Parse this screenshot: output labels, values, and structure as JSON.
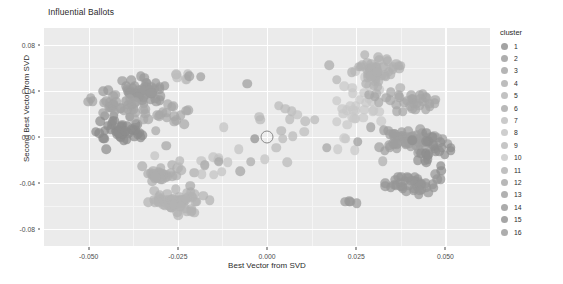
{
  "chart_data": {
    "type": "scatter",
    "title": "Influential Ballots",
    "xlabel": "Best Vector from SVD",
    "ylabel": "Second Best Vector from SVD",
    "xlim": [
      -0.0625,
      0.0625
    ],
    "ylim": [
      -0.095,
      0.095
    ],
    "xticks": [
      "-0.050",
      "-0.025",
      "0.000",
      "0.025",
      "0.050"
    ],
    "xtick_values": [
      -0.05,
      -0.025,
      0.0,
      0.025,
      0.05
    ],
    "yticks": [
      "0.08",
      "0.04",
      "0.00",
      "-0.04",
      "-0.08"
    ],
    "ytick_values": [
      0.08,
      0.04,
      0.0,
      -0.04,
      -0.08
    ],
    "grid": true,
    "panel_background": "#ebebeb",
    "gridline_color": "#ffffff",
    "legend": {
      "title": "cluster",
      "position": "right",
      "entries": [
        {
          "label": "1",
          "color": "#8c8c8c"
        },
        {
          "label": "2",
          "color": "#9a9a9a"
        },
        {
          "label": "3",
          "color": "#a3a3a3"
        },
        {
          "label": "4",
          "color": "#adadad"
        },
        {
          "label": "5",
          "color": "#b3b3b3"
        },
        {
          "label": "6",
          "color": "#a8a8a8"
        },
        {
          "label": "7",
          "color": "#bdbdbd"
        },
        {
          "label": "8",
          "color": "#c2c2c2"
        },
        {
          "label": "9",
          "color": "#b8b8b8"
        },
        {
          "label": "10",
          "color": "#c7c7c7"
        },
        {
          "label": "11",
          "color": "#b0b0b0"
        },
        {
          "label": "12",
          "color": "#a6a6a6"
        },
        {
          "label": "13",
          "color": "#9e9e9e"
        },
        {
          "label": "14",
          "color": "#969696"
        },
        {
          "label": "15",
          "color": "#8f8f8f"
        },
        {
          "label": "16",
          "color": "#999999"
        }
      ]
    },
    "marker": {
      "size_px": 9.5,
      "opacity": 0.72,
      "highlight_marker": {
        "x": 0.0,
        "y": 0.0,
        "style": "open-circle",
        "size_px": 11,
        "stroke": "#8a8a8a"
      }
    },
    "clusters": [
      {
        "cluster": 1,
        "color": "#8c8c8c",
        "cx": -0.0415,
        "cy": 0.0055,
        "sx": 0.0032,
        "sy": 0.0062,
        "n": 46
      },
      {
        "cluster": 2,
        "color": "#9a9a9a",
        "cx": -0.0345,
        "cy": 0.04,
        "sx": 0.0042,
        "sy": 0.005,
        "n": 54
      },
      {
        "cluster": 3,
        "color": "#a3a3a3",
        "cx": -0.0418,
        "cy": 0.0275,
        "sx": 0.003,
        "sy": 0.0042,
        "n": 26
      },
      {
        "cluster": 4,
        "color": "#adadad",
        "cx": -0.03,
        "cy": -0.0335,
        "sx": 0.003,
        "sy": 0.0038,
        "n": 32
      },
      {
        "cluster": 5,
        "color": "#b3b3b3",
        "cx": -0.026,
        "cy": -0.0555,
        "sx": 0.0035,
        "sy": 0.0055,
        "n": 58
      },
      {
        "cluster": 6,
        "color": "#a8a8a8",
        "cx": -0.0295,
        "cy": 0.019,
        "sx": 0.0035,
        "sy": 0.0055,
        "n": 24
      },
      {
        "cluster": 7,
        "color": "#bdbdbd",
        "cx": -0.0245,
        "cy": 0.053,
        "sx": 0.0022,
        "sy": 0.0022,
        "n": 6
      },
      {
        "cluster": 8,
        "color": "#c2c2c2",
        "cx": -0.013,
        "cy": -0.0255,
        "sx": 0.007,
        "sy": 0.012,
        "n": 14
      },
      {
        "cluster": 9,
        "color": "#b8b8b8",
        "cx": 0.0055,
        "cy": 0.009,
        "sx": 0.0055,
        "sy": 0.018,
        "n": 12
      },
      {
        "cluster": 10,
        "color": "#c7c7c7",
        "cx": 0.0255,
        "cy": 0.029,
        "sx": 0.0038,
        "sy": 0.015,
        "n": 36
      },
      {
        "cluster": 11,
        "color": "#b0b0b0",
        "cx": 0.031,
        "cy": 0.056,
        "sx": 0.003,
        "sy": 0.007,
        "n": 48
      },
      {
        "cluster": 12,
        "color": "#a6a6a6",
        "cx": 0.04,
        "cy": 0.0305,
        "sx": 0.0045,
        "sy": 0.0045,
        "n": 34
      },
      {
        "cluster": 13,
        "color": "#9e9e9e",
        "cx": 0.04,
        "cy": -0.0035,
        "sx": 0.005,
        "sy": 0.006,
        "n": 56
      },
      {
        "cluster": 14,
        "color": "#969696",
        "cx": 0.04,
        "cy": -0.0405,
        "sx": 0.004,
        "sy": 0.0045,
        "n": 40
      },
      {
        "cluster": 15,
        "color": "#8f8f8f",
        "cx": 0.0465,
        "cy": -0.013,
        "sx": 0.0032,
        "sy": 0.008,
        "n": 24
      },
      {
        "cluster": 16,
        "color": "#999999",
        "cx": 0.0238,
        "cy": -0.0565,
        "sx": 0.0015,
        "sy": 0.0018,
        "n": 4
      }
    ],
    "extra_points": [
      {
        "x": -0.0218,
        "y": 0.053,
        "color": "#a0a0a0"
      },
      {
        "x": -0.0185,
        "y": 0.0525,
        "color": "#9e9e9e"
      },
      {
        "x": -0.0283,
        "y": -0.0075,
        "color": "#a5a5a5"
      },
      {
        "x": -0.0245,
        "y": -0.0205,
        "color": "#b5b5b5"
      },
      {
        "x": -0.024,
        "y": -0.029,
        "color": "#b0b0b0"
      },
      {
        "x": -0.0215,
        "y": -0.0425,
        "color": "#a8a8a8"
      },
      {
        "x": -0.0175,
        "y": -0.0245,
        "color": "#acacac"
      },
      {
        "x": -0.016,
        "y": -0.055,
        "color": "#b2b2b2"
      },
      {
        "x": -0.0135,
        "y": -0.0215,
        "color": "#a6a6a6"
      },
      {
        "x": -0.0075,
        "y": -0.03,
        "color": "#a2a2a2"
      },
      {
        "x": -0.0045,
        "y": -0.0215,
        "color": "#aaaaaa"
      },
      {
        "x": -0.0055,
        "y": 0.0465,
        "color": "#9d9d9d"
      },
      {
        "x": -0.0035,
        "y": -0.0015,
        "color": "#8f8f8f"
      },
      {
        "x": 0.004,
        "y": 0.0055,
        "color": "#b4b4b4"
      },
      {
        "x": 0.0085,
        "y": 0.0195,
        "color": "#c0c0c0"
      },
      {
        "x": 0.0105,
        "y": 0.0045,
        "color": "#bcbcbc"
      },
      {
        "x": 0.0175,
        "y": 0.0625,
        "color": "#a9a9a9"
      },
      {
        "x": 0.0195,
        "y": 0.05,
        "color": "#b6b6b6"
      },
      {
        "x": 0.0168,
        "y": -0.0095,
        "color": "#a4a4a4"
      },
      {
        "x": 0.0325,
        "y": -0.021,
        "color": "#adadad"
      },
      {
        "x": 0.0255,
        "y": -0.004,
        "color": "#9b9b9b"
      }
    ]
  }
}
